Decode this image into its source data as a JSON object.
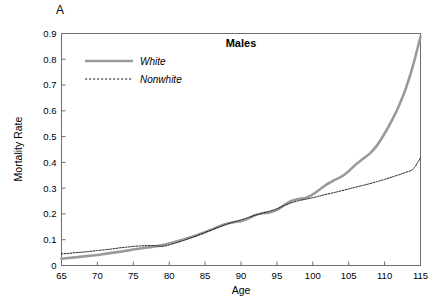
{
  "panel": {
    "label": "A"
  },
  "chart_data": {
    "type": "line",
    "title": "Males",
    "xlabel": "Age",
    "ylabel": "Mortality Rate",
    "xlim": [
      65,
      115
    ],
    "ylim": [
      0,
      0.9
    ],
    "xticks": [
      65,
      70,
      75,
      80,
      85,
      90,
      95,
      100,
      105,
      110,
      115
    ],
    "xtick_labels": [
      "65",
      "70",
      "75",
      "80",
      "85",
      "90",
      "95",
      "100",
      "105",
      "110",
      "115"
    ],
    "yticks": [
      0,
      0.1,
      0.2,
      0.3,
      0.4,
      0.5,
      0.6,
      0.7,
      0.8,
      0.9
    ],
    "ytick_labels": [
      "0",
      "0.1",
      "0.2",
      "0.3",
      "0.4",
      "0.5",
      "0.6",
      "0.7",
      "0.8",
      "0.9"
    ],
    "grid": false,
    "legend_position": "upper-left",
    "series": [
      {
        "name": "White",
        "style": "solid",
        "color": "#9a9a9a",
        "width": 2.6,
        "x": [
          65,
          66,
          67,
          68,
          69,
          70,
          71,
          72,
          73,
          74,
          75,
          76,
          77,
          78,
          79,
          80,
          81,
          82,
          83,
          84,
          85,
          86,
          87,
          88,
          89,
          90,
          91,
          92,
          93,
          94,
          95,
          96,
          97,
          98,
          99,
          100,
          101,
          102,
          103,
          104,
          105,
          106,
          107,
          108,
          109,
          110,
          111,
          112,
          113,
          114,
          115
        ],
        "values": [
          0.026,
          0.029,
          0.032,
          0.035,
          0.038,
          0.041,
          0.045,
          0.049,
          0.053,
          0.057,
          0.062,
          0.066,
          0.07,
          0.074,
          0.079,
          0.085,
          0.093,
          0.101,
          0.11,
          0.119,
          0.129,
          0.14,
          0.152,
          0.162,
          0.168,
          0.172,
          0.182,
          0.196,
          0.203,
          0.206,
          0.216,
          0.234,
          0.25,
          0.258,
          0.262,
          0.276,
          0.296,
          0.316,
          0.331,
          0.345,
          0.366,
          0.392,
          0.414,
          0.436,
          0.468,
          0.512,
          0.562,
          0.62,
          0.69,
          0.78,
          0.888
        ]
      },
      {
        "name": "Nonwhite",
        "style": "dashed",
        "color": "#1a1a1a",
        "width": 1.0,
        "x": [
          65,
          66,
          67,
          68,
          69,
          70,
          71,
          72,
          73,
          74,
          75,
          76,
          77,
          78,
          79,
          80,
          81,
          82,
          83,
          84,
          85,
          86,
          87,
          88,
          89,
          90,
          91,
          92,
          93,
          94,
          95,
          96,
          97,
          98,
          99,
          100,
          101,
          102,
          103,
          104,
          105,
          106,
          107,
          108,
          109,
          110,
          111,
          112,
          113,
          114,
          115
        ],
        "values": [
          0.045,
          0.047,
          0.05,
          0.052,
          0.055,
          0.058,
          0.061,
          0.064,
          0.068,
          0.071,
          0.074,
          0.076,
          0.077,
          0.077,
          0.074,
          0.08,
          0.088,
          0.097,
          0.107,
          0.117,
          0.128,
          0.139,
          0.15,
          0.16,
          0.169,
          0.177,
          0.186,
          0.195,
          0.203,
          0.211,
          0.22,
          0.232,
          0.243,
          0.251,
          0.257,
          0.263,
          0.27,
          0.277,
          0.283,
          0.29,
          0.297,
          0.304,
          0.311,
          0.318,
          0.326,
          0.334,
          0.343,
          0.352,
          0.362,
          0.375,
          0.418
        ]
      }
    ],
    "legend": [
      {
        "label": "White",
        "style": "solid",
        "color": "#9a9a9a"
      },
      {
        "label": "Nonwhite",
        "style": "dashed",
        "color": "#1a1a1a"
      }
    ]
  }
}
